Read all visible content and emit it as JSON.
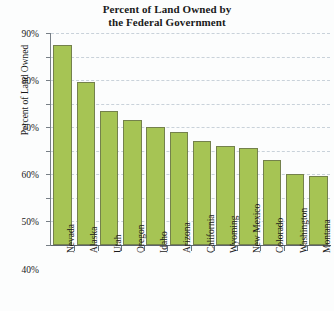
{
  "chart_data": {
    "type": "bar",
    "title": "Percent of Land Owned by the Federal Government",
    "title_lines": [
      "Percent of Land Owned by",
      "the Federal Government"
    ],
    "xlabel": "",
    "ylabel": "Percent of Land Owned",
    "categories": [
      "Nevada",
      "Alaska",
      "Utah",
      "Oregon",
      "Idaho",
      "Arizona",
      "California",
      "Wyoming",
      "New Mexico",
      "Colorado",
      "Washington",
      "Montana"
    ],
    "values": [
      85,
      69,
      57,
      53,
      50,
      48,
      44,
      42,
      41,
      36,
      30,
      29.5
    ],
    "ylim": [
      0,
      90
    ],
    "ytick_values": [
      0,
      10,
      20,
      30,
      40,
      50,
      60,
      70,
      80,
      90
    ],
    "ytick_labels": [
      "0%",
      "10%",
      "20%",
      "30%",
      "40%",
      "50%",
      "60%",
      "70%",
      "80%",
      "90%"
    ],
    "grid": "horizontal-dashed",
    "legend": "none",
    "bar_color": "#a6c454",
    "bar_edge_color": "#74814c",
    "gridline_color": "#c9d2da",
    "axis_color": "#5d656c"
  }
}
